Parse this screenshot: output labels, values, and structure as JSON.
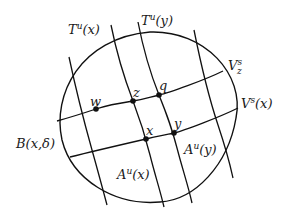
{
  "diagram": {
    "colors": {
      "stroke": "#111111",
      "background": "#ffffff",
      "text": "#1a1a1a"
    },
    "ball": {
      "label": "B(x,δ)",
      "label_base": "B",
      "label_args": "(x,δ)",
      "cx": 148,
      "cy": 117,
      "rx": 89,
      "ry": 85
    },
    "unstable_curves": [
      {
        "name": "T^u(x)",
        "label_base": "T",
        "label_sup": "u",
        "label_arg": "(x)",
        "points": [
          [
            111,
            25
          ],
          [
            120,
            70
          ],
          [
            133,
            101
          ],
          [
            146,
            139
          ],
          [
            164,
            207
          ]
        ]
      },
      {
        "name": "T^u(y)",
        "label_base": "T",
        "label_sup": "u",
        "label_arg": "(y)",
        "points": [
          [
            138,
            22
          ],
          [
            147,
            60
          ],
          [
            159,
            95
          ],
          [
            174,
            133
          ],
          [
            192,
            203
          ]
        ]
      },
      {
        "name": "left-curve",
        "points": [
          [
            69,
            57
          ],
          [
            80,
            100
          ],
          [
            92,
            150
          ],
          [
            107,
            205
          ]
        ]
      },
      {
        "name": "right-curve",
        "points": [
          [
            194,
            30
          ],
          [
            205,
            80
          ],
          [
            220,
            130
          ],
          [
            233,
            178
          ]
        ]
      }
    ],
    "stable_curves": [
      {
        "name": "V_z^s",
        "label_base": "V",
        "label_sup": "s",
        "label_sub": "z",
        "points": [
          [
            57,
            121
          ],
          [
            96,
            109
          ],
          [
            133,
            101
          ],
          [
            159,
            95
          ],
          [
            223,
            71
          ]
        ]
      },
      {
        "name": "V^s(x)",
        "label_base": "V",
        "label_sup": "s",
        "label_arg": "(x)",
        "points": [
          [
            70,
            157
          ],
          [
            110,
            148
          ],
          [
            146,
            139
          ],
          [
            174,
            133
          ],
          [
            238,
            108
          ]
        ]
      }
    ],
    "points": [
      {
        "name": "w",
        "label": "w",
        "x": 96,
        "y": 109
      },
      {
        "name": "z",
        "label": "z",
        "x": 133,
        "y": 101
      },
      {
        "name": "q",
        "label": "q",
        "x": 159,
        "y": 95
      },
      {
        "name": "x",
        "label": "x",
        "x": 146,
        "y": 139
      },
      {
        "name": "y",
        "label": "y",
        "x": 174,
        "y": 133
      }
    ],
    "region_labels": [
      {
        "name": "A^u(x)",
        "label_base": "A",
        "label_sup": "u",
        "label_arg": "(x)"
      },
      {
        "name": "A^u(y)",
        "label_base": "A",
        "label_sup": "u",
        "label_arg": "(y)"
      }
    ]
  }
}
